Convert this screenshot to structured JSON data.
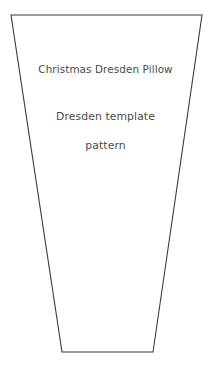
{
  "document": {
    "kind": "sewing-pattern-template",
    "shape_name": "dresden-wedge-trapezoid"
  },
  "labels": {
    "title": "Christmas Dresden Pillow",
    "subtitle_line_1": "Dresden template",
    "subtitle_line_2": "pattern"
  },
  "colors": {
    "background": "#ffffff",
    "outline": "#3b3b3b",
    "text": "#4a4a4a"
  },
  "geometry": {
    "top_left_x": 11,
    "top_left_y": 15,
    "top_right_x": 202,
    "top_right_y": 15,
    "bottom_right_x": 153,
    "bottom_right_y": 352,
    "bottom_left_x": 62,
    "bottom_left_y": 352,
    "points": "11,15 202,15 153,352 62,352"
  }
}
